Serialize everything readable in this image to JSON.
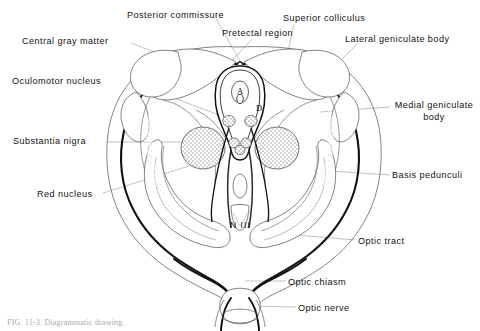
{
  "figure": {
    "caption": "FIG. 11-3.  Diagrammatic drawing.",
    "ink_color": "#111111",
    "leader_color": "#8e8e8e",
    "outline_color": "#4a4a4a",
    "background": "#ffffff"
  },
  "labels_left": [
    {
      "id": "central-gray-matter",
      "text": "Central gray matter",
      "x": 22,
      "y": 36
    },
    {
      "id": "oculomotor-nucleus",
      "text": "Oculomotor nucleus",
      "x": 12,
      "y": 76
    },
    {
      "id": "substantia-nigra",
      "text": "Substantia nigra",
      "x": 13,
      "y": 136
    },
    {
      "id": "red-nucleus",
      "text": "Red nucleus",
      "x": 37,
      "y": 189
    }
  ],
  "labels_top": [
    {
      "id": "posterior-commissure",
      "text": "Posterior commissure",
      "x": 127,
      "y": 10
    },
    {
      "id": "pretectal-region",
      "text": "Pretectal region",
      "x": 222,
      "y": 28
    },
    {
      "id": "superior-colliculus",
      "text": "Superior colliculus",
      "x": 283,
      "y": 13
    }
  ],
  "labels_right": [
    {
      "id": "lateral-geniculate-body",
      "text": "Lateral geniculate body",
      "x": 345,
      "y": 34
    },
    {
      "id": "medial-geniculate-body",
      "text": "Medial geniculate body",
      "x": 393,
      "y": 100
    },
    {
      "id": "basis-pedunculi",
      "text": "Basis pedunculi",
      "x": 392,
      "y": 170
    },
    {
      "id": "optic-tract",
      "text": "Optic tract",
      "x": 358,
      "y": 236
    },
    {
      "id": "optic-chiasm",
      "text": "Optic chiasm",
      "x": 288,
      "y": 277
    },
    {
      "id": "optic-nerve",
      "text": "Optic nerve",
      "x": 298,
      "y": 303
    }
  ],
  "inline_marks": [
    {
      "id": "aqueduct-mark",
      "text": "A",
      "x": 237,
      "y": 90
    },
    {
      "id": "darkschewitsch-mark",
      "text": "D",
      "x": 256,
      "y": 106
    },
    {
      "id": "nerve-three-mark",
      "text": "N III",
      "x": 230,
      "y": 220
    }
  ]
}
